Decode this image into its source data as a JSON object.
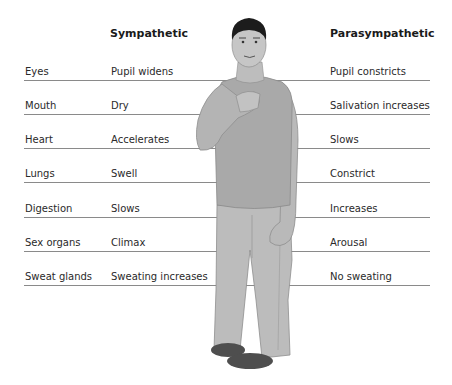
{
  "headers": {
    "sympathetic": "Sympathetic",
    "parasympathetic": "Parasympathetic"
  },
  "rows": [
    {
      "organ": "Eyes",
      "sympathetic": "Pupil widens",
      "parasympathetic": "Pupil constricts"
    },
    {
      "organ": "Mouth",
      "sympathetic": "Dry",
      "parasympathetic": "Salivation increases"
    },
    {
      "organ": "Heart",
      "sympathetic": "Accelerates",
      "parasympathetic": "Slows"
    },
    {
      "organ": "Lungs",
      "sympathetic": "Swell",
      "parasympathetic": "Constrict"
    },
    {
      "organ": "Digestion",
      "sympathetic": "Slows",
      "parasympathetic": "Increases"
    },
    {
      "organ": "Sex organs",
      "sympathetic": "Climax",
      "parasympathetic": "Arousal"
    },
    {
      "organ": "Sweat glands",
      "sympathetic": "Sweating increases",
      "parasympathetic": "No sweating"
    }
  ],
  "figure": {
    "icon": "standing-man-hand-on-chest-icon",
    "colors": {
      "skin": "#b9b9b9",
      "shirt": "#a9a9a9",
      "pants": "#bcbcbc",
      "hair": "#1c1c1c",
      "shoes": "#4e4e4e"
    }
  }
}
